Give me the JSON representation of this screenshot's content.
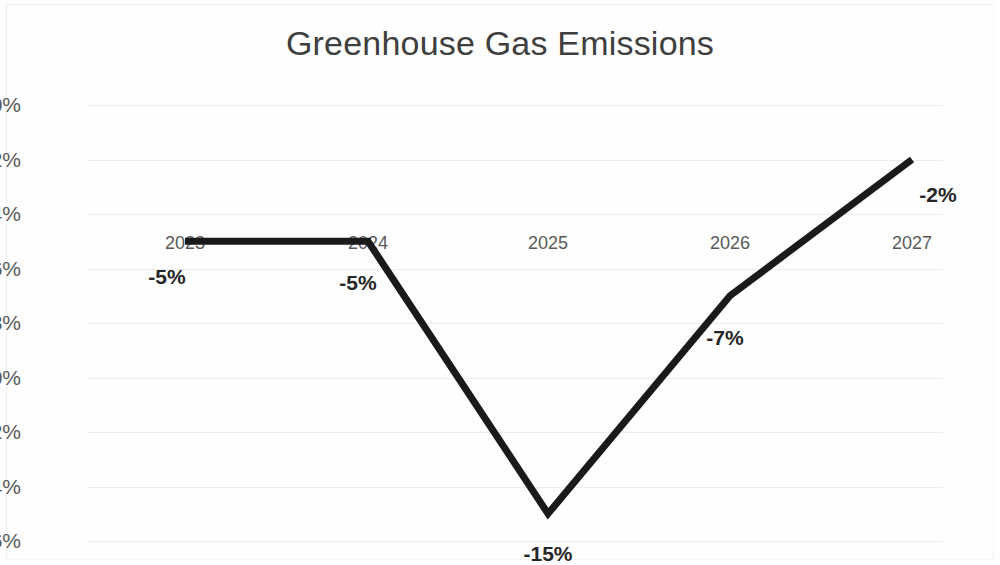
{
  "chart_data": {
    "type": "line",
    "title": "Greenhouse Gas Emissions",
    "xlabel": "",
    "ylabel": "",
    "categories": [
      "2023",
      "2024",
      "2025",
      "2026",
      "2027"
    ],
    "values": [
      -5,
      -5,
      -15,
      -7,
      -2
    ],
    "data_labels": [
      "-5%",
      "-5%",
      "-15%",
      "-7%",
      "-2%"
    ],
    "yticks": [
      "0%",
      "-2%",
      "-4%",
      "-6%",
      "-8%",
      "-10%",
      "-12%",
      "-14%",
      "-16%"
    ],
    "ytick_values": [
      0,
      -2,
      -4,
      -6,
      -8,
      -10,
      -12,
      -14,
      -16
    ],
    "ylim": [
      -16,
      0
    ],
    "grid": true,
    "legend": false,
    "legend_position": "none",
    "series": [
      {
        "name": "Greenhouse Gas Emissions",
        "values": [
          -5,
          -5,
          -15,
          -7,
          -2
        ],
        "color": "#1a1a1a",
        "line_width": 7,
        "markers": false
      }
    ],
    "colors": {
      "line": "#1a1a1a",
      "gridline": "#ededf0",
      "tick_text": "#595959",
      "title_text": "#3f3f3f",
      "label_text": "#262626",
      "background": "#fefefe"
    }
  }
}
